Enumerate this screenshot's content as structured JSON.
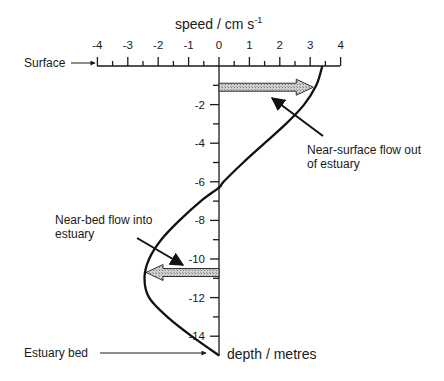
{
  "diagram": {
    "title": "speed / cm s",
    "title_superscript": "-1",
    "x_axis": {
      "label": "speed / cm s-1",
      "ticks": [
        -4,
        -3,
        -2,
        -1,
        0,
        1,
        2,
        3,
        4
      ],
      "tick_labels": [
        "-4",
        "-3",
        "-2",
        "-1",
        "0",
        "1",
        "2",
        "3",
        "4"
      ],
      "minor_ticks": true,
      "range": [
        -4,
        4
      ]
    },
    "y_axis": {
      "label": "depth / metres",
      "ticks": [
        -2,
        -4,
        -6,
        -8,
        -10,
        -12,
        -14
      ],
      "tick_labels": [
        "-2",
        "-4",
        "-6",
        "-8",
        "-10",
        "-12",
        "-14"
      ],
      "minor_ticks": [
        -1,
        -3,
        -5,
        -7,
        -9,
        -11,
        -13
      ],
      "range": [
        0,
        -15
      ]
    },
    "labels": {
      "surface": "Surface",
      "bed": "Estuary bed",
      "depth_axis": "depth / metres",
      "surface_flow_line1": "Near-surface flow out",
      "surface_flow_line2": "of estuary",
      "bed_flow_line1": "Near-bed flow into",
      "bed_flow_line2": "estuary"
    },
    "velocity_profile": {
      "description": "Estuarine residual velocity vs depth",
      "points": [
        {
          "depth": 0,
          "speed": 3.4
        },
        {
          "depth": -1,
          "speed": 3.2
        },
        {
          "depth": -2,
          "speed": 2.8
        },
        {
          "depth": -3,
          "speed": 2.2
        },
        {
          "depth": -4,
          "speed": 1.5
        },
        {
          "depth": -5,
          "speed": 0.8
        },
        {
          "depth": -6,
          "speed": 0.15
        },
        {
          "depth": -6.3,
          "speed": 0.0
        },
        {
          "depth": -7,
          "speed": -0.6
        },
        {
          "depth": -8,
          "speed": -1.3
        },
        {
          "depth": -9,
          "speed": -1.9
        },
        {
          "depth": -10,
          "speed": -2.3
        },
        {
          "depth": -11,
          "speed": -2.45
        },
        {
          "depth": -12,
          "speed": -2.3
        },
        {
          "depth": -13,
          "speed": -1.7
        },
        {
          "depth": -14,
          "speed": -0.9
        },
        {
          "depth": -15,
          "speed": 0.0
        }
      ]
    },
    "flow_arrows": [
      {
        "name": "surface-outflow",
        "depth": -1.1,
        "from_speed": 0,
        "to_speed": 3.1,
        "direction": "seaward"
      },
      {
        "name": "bed-inflow",
        "depth": -10.7,
        "from_speed": 0,
        "to_speed": -2.4,
        "direction": "landward"
      }
    ],
    "colors": {
      "ink": "#111111",
      "arrow_fill": "#b8b8b8",
      "background": "#ffffff"
    }
  }
}
